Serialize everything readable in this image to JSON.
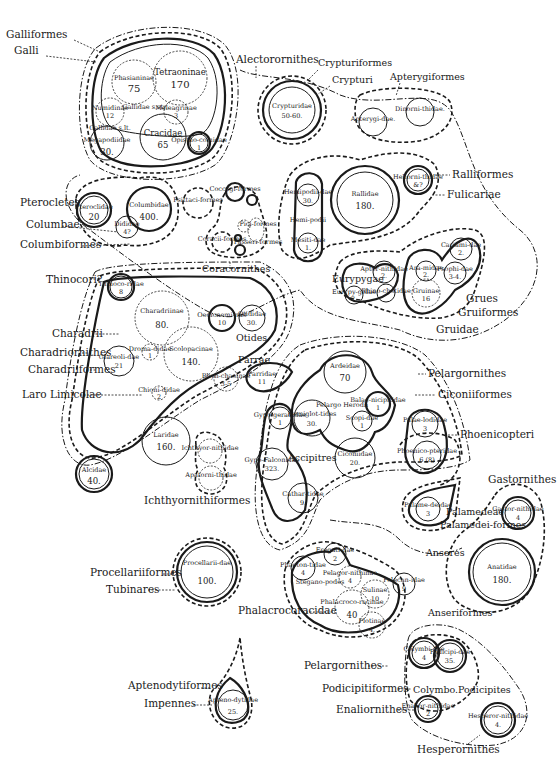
{
  "diagram": {
    "groups": {
      "galliformes": {
        "label": "Galliformes",
        "sub": "Galli",
        "gallidae_str": "Gallidae s.str.",
        "gallidae_lat": "Gallidae s.lt."
      },
      "alectorornithes": {
        "label": "Alectorornithes"
      },
      "crypturiformes": {
        "label": "Crypturiformes",
        "sub": "Crypturi"
      },
      "apterygiformes": {
        "label": "Apterygiformes"
      },
      "ralliformes": {
        "label": "Ralliformes",
        "sub": "Fulicariae",
        "heliornithidae_hemipodii": "Hemi-podii"
      },
      "columbiformes": {
        "label": "Columbiformes",
        "pterocletes": "Pterocletes",
        "columbae": "Columbae"
      },
      "coracornithes": {
        "label": "Coracornithes"
      },
      "gruiformes": {
        "label": "Gruiformes",
        "grues": "Grues",
        "gruidae": "Gruidae",
        "eurypygae": "Eurypygae"
      },
      "charadriiformes": {
        "label": "Charadriiformes",
        "thinocori": "Thinocori?",
        "charadrii": "Charadrii",
        "charadriornithes": "Charadriornithes",
        "laro_limicolae": "Laro Limicolae",
        "otides": "Otides",
        "parrae": "Parrae"
      },
      "ichthyornithiformes": {
        "label": "Ichthyornithiformes"
      },
      "pelargornithes": {
        "label": "Pelargornithes",
        "ciconiiformes": "Ciconiiformes",
        "phoenicopteri": "Phoenicopteri",
        "pelargo_herodii": "Pelargo Herodii",
        "accipitres": "Accipitres",
        "steganopodes": "Stegano-podes"
      },
      "anseriformes": {
        "label": "Anseriformes",
        "anseres": "Anseres",
        "palamedeae": "Palamedeae",
        "palamediformes": "Palamedei-formes",
        "gastornithes": "Gastornithes"
      },
      "procellariiformes": {
        "label": "Procellariiformes",
        "sub": "Tubinares"
      },
      "phalacrocoracidae": {
        "label": "Phalacrocoracidae"
      },
      "aptenodytiformes": {
        "label": "Aptenodytiformes",
        "sub": "Impennes"
      },
      "podicipitiformes": {
        "label": "Podicipitiformes",
        "pelargornithes2": "Pelargornithes",
        "colymbo": "Colymbo.Podicipites",
        "enaliornithes": "Enaliornithes",
        "hesperornithes": "Hesperornithes"
      }
    },
    "families": {
      "tetraoninae": {
        "name": "Tetraoninae",
        "count": "170"
      },
      "phasianinae": {
        "name": "Phasianinae",
        "count": "75"
      },
      "numididae": {
        "name": "Numidinae",
        "count": "12"
      },
      "meleagrinae": {
        "name": "Meleagrinae",
        "count": "3"
      },
      "cracidae": {
        "name": "Cracidae",
        "count": "65"
      },
      "megapodiidae": {
        "name": "Megapodiidae",
        "count": "30."
      },
      "opisthocomidae": {
        "name": "Opistho-comidae",
        "count": "1"
      },
      "crypturidae": {
        "name": "Crypturidae",
        "count": "50-60."
      },
      "apterygidae": {
        "name": "Apterygi-dae.",
        "count": ""
      },
      "dinornithidae": {
        "name": "Dinorni-thidae.",
        "count": ""
      },
      "rallidae": {
        "name": "Rallidae",
        "count": "180."
      },
      "heliornithidae": {
        "name": "Heliorni-thidae",
        "count": "&?"
      },
      "hemipodiidae": {
        "name": "Hemipodii-dae",
        "count": "30."
      },
      "mesitidae": {
        "name": "Mesiti-dae",
        "count": "1."
      },
      "pteroclidae": {
        "name": "Pteroclidae",
        "count": "20"
      },
      "columbidae": {
        "name": "Columbidae",
        "count": "400."
      },
      "didiidae": {
        "name": "Dididae",
        "count": "4?"
      },
      "psittaciformes": {
        "name": "Psittaci-formes",
        "count": ""
      },
      "coccygiformes": {
        "name": "Coccygi-formes",
        "count": ""
      },
      "coraciiformes": {
        "name": "Coracii-formes",
        "count": ""
      },
      "piciformes": {
        "name": "Pici-formes",
        "count": ""
      },
      "passeriformes": {
        "name": "Passeri-formes",
        "count": ""
      },
      "aptornithidae": {
        "name": "Aptor-nithidae",
        "count": "2."
      },
      "rhinochetidae": {
        "name": "Rhino-chetidae",
        "count": ""
      },
      "eurypygidae": {
        "name": "Eurypy-gidae",
        "count": "2."
      },
      "aramidae": {
        "name": "Ara-midae",
        "count": "2."
      },
      "gruinae": {
        "name": "Gruinae",
        "count": "16"
      },
      "psophiidae": {
        "name": "Psophi-dae",
        "count": "3-4."
      },
      "cariamidae": {
        "name": "Cariami-dae",
        "count": "2."
      },
      "thinocoridae": {
        "name": "Thinoco-ridae",
        "count": "8"
      },
      "charadriinae": {
        "name": "Charadriinae",
        "count": "80."
      },
      "oedicnemidae": {
        "name": "Oedicnemi-nae",
        "count": "10"
      },
      "otididae": {
        "name": "Otididae",
        "count": "30."
      },
      "glareolidae": {
        "name": "Glareoli-dae",
        "count": "21"
      },
      "dromadidae": {
        "name": "Droma-didae",
        "count": "1"
      },
      "scolopacinae": {
        "name": "Scolopacinae",
        "count": "140."
      },
      "rhynchaeinae": {
        "name": "Rhyn-chaeinae",
        "count": "3-5"
      },
      "parridae": {
        "name": "Parridae",
        "count": "11"
      },
      "chionididae": {
        "name": "Chioni-didae",
        "count": "2"
      },
      "laridae": {
        "name": "Laridae",
        "count": "160."
      },
      "alcidae": {
        "name": "Alcidae",
        "count": "40."
      },
      "ichthyornithidae": {
        "name": "Ichthyor-nithidae",
        "count": ""
      },
      "apatornithidae": {
        "name": "Apatorni-thidae",
        "count": ""
      },
      "ardeidae": {
        "name": "Ardeidae",
        "count": "70"
      },
      "balaenicipitidae": {
        "name": "Balae-nicipitidae",
        "count": "1"
      },
      "scopidae": {
        "name": "Scopi-dae",
        "count": "1"
      },
      "hemiglottidae": {
        "name": "Hemiglot-tides",
        "count": "30."
      },
      "ciconiidae": {
        "name": "Ciconiidae",
        "count": "20."
      },
      "palaelodidae": {
        "name": "Palae-lodidae",
        "count": "3"
      },
      "phoenicopteridae": {
        "name": "Phoenico-pteridae",
        "count": "6 (8)"
      },
      "gypogeranidae": {
        "name": "Gypo-geranidae",
        "count": "1"
      },
      "gypofalconidae": {
        "name": "Gypo-Falconidae",
        "count": "323."
      },
      "cathartidae": {
        "name": "Cathar-tidae",
        "count": "9."
      },
      "palamedeidae": {
        "name": "Palame-deidae",
        "count": "3"
      },
      "gastornithidae": {
        "name": "Gastor-nithidae",
        "count": "4"
      },
      "anatidae": {
        "name": "Anatidae",
        "count": "180."
      },
      "procellariidae": {
        "name": "Procellarii-dae",
        "count": "100."
      },
      "phaethontidae": {
        "name": "Phaeton-tidae",
        "count": "4"
      },
      "fregatidae": {
        "name": "Fregati-dae",
        "count": "2"
      },
      "pelagornithinae": {
        "name": "Pelagor-nithinae",
        "count": "4"
      },
      "sulinae": {
        "name": "Sulinae",
        "count": "10"
      },
      "phalacrocoracinae": {
        "name": "Phalacroco-racinae",
        "count": "40"
      },
      "plotinae": {
        "name": "Plotinae",
        "count": "4."
      },
      "pelecanidae": {
        "name": "Pelecan-idae",
        "count": "9"
      },
      "aptenodytidae": {
        "name": "Apteno-dytidae",
        "count": "25."
      },
      "colymbidae": {
        "name": "Colymbi-dae",
        "count": "4"
      },
      "podicipidae": {
        "name": "Podicipi-dae",
        "count": "35."
      },
      "enaliornithidae": {
        "name": "Enalior-nithidae",
        "count": "2"
      },
      "hesperornithidae": {
        "name": "Hesperor-nithidae",
        "count": "4."
      }
    }
  }
}
